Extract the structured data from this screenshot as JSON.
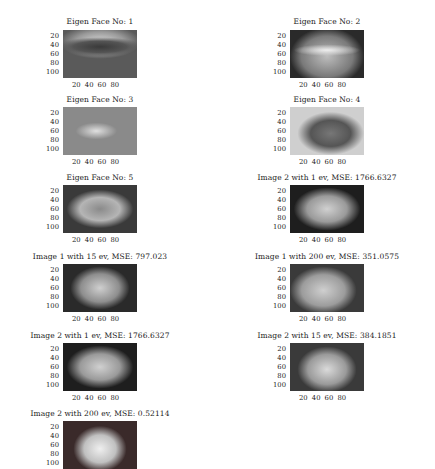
{
  "figure": {
    "yticks": [
      "20",
      "40",
      "60",
      "80",
      "100"
    ],
    "xticks": "20 40 60 80",
    "subplots": [
      {
        "title": "Eigen Face No: 1",
        "type": "eigenface",
        "shows_xticks": true
      },
      {
        "title": "Eigen Face No: 2",
        "type": "eigenface",
        "shows_xticks": true
      },
      {
        "title": "Eigen Face No: 3",
        "type": "eigenface",
        "shows_xticks": true
      },
      {
        "title": "Eigen Face No: 4",
        "type": "eigenface",
        "shows_xticks": true
      },
      {
        "title": "Eigen Face No: 5",
        "type": "eigenface",
        "shows_xticks": true
      },
      {
        "title": "Image 2 with 1 ev, MSE: 1766.6327",
        "type": "reconstruction",
        "shows_xticks": true
      },
      {
        "title": "Image 1 with 15 ev, MSE: 797.023",
        "type": "reconstruction",
        "shows_xticks": true
      },
      {
        "title": "Image 1 with 200 ev, MSE: 351.0575",
        "type": "reconstruction",
        "shows_xticks": true
      },
      {
        "title": "Image 2 with 1 ev, MSE: 1766.6327",
        "type": "reconstruction",
        "shows_xticks": true
      },
      {
        "title": "Image 2 with 15 ev, MSE: 384.1851",
        "type": "reconstruction",
        "shows_xticks": true
      },
      {
        "title": "Image 2 with 200 ev, MSE: 0.52114",
        "type": "reconstruction",
        "shows_xticks": false
      }
    ]
  },
  "chart_data": {
    "type": "table",
    "columns": [
      "image",
      "eigenvectors",
      "mse"
    ],
    "rows": [
      [
        "Image 2",
        1,
        1766.6327
      ],
      [
        "Image 1",
        15,
        797.023
      ],
      [
        "Image 1",
        200,
        351.0575
      ],
      [
        "Image 2",
        1,
        1766.6327
      ],
      [
        "Image 2",
        15,
        384.1851
      ],
      [
        "Image 2",
        200,
        0.52114
      ]
    ],
    "eigenfaces_shown": [
      1,
      2,
      3,
      4,
      5
    ],
    "axis": {
      "xticks": [
        20,
        40,
        60,
        80
      ],
      "yticks": [
        20,
        40,
        60,
        80,
        100
      ]
    }
  }
}
